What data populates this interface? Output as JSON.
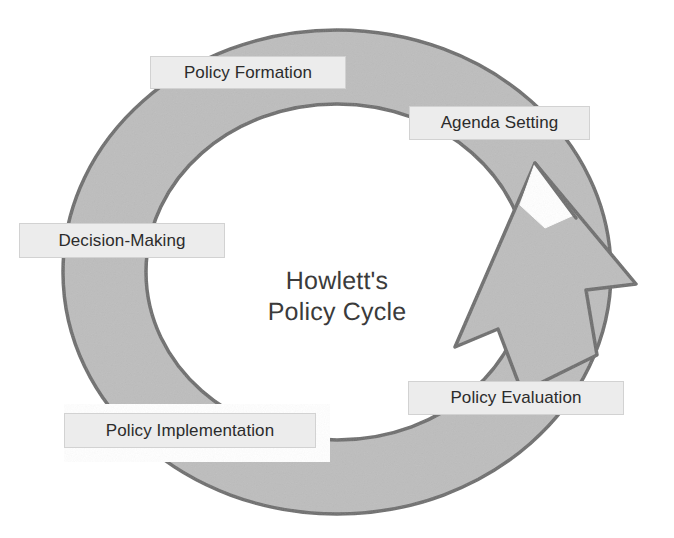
{
  "diagram": {
    "kind": "policy-cycle-diagram",
    "center_title": "Howlett's\nPolicy Cycle",
    "center_title_line1": "Howlett's",
    "center_title_line2": "Policy Cycle",
    "background_color": "#ffffff",
    "ring": {
      "fill_color": "#bdbdbd",
      "outline_color": "#6e6e6e",
      "center_x": 337,
      "center_y": 272,
      "outer_radius_x": 274,
      "outer_radius_y": 242,
      "inner_radius_x": 191,
      "inner_radius_y": 168,
      "direction": "clockwise"
    },
    "arrow": {
      "name": "cycle-arrow-head",
      "fill_color": "#bdbdbd",
      "outline_color": "#6e6e6e",
      "points_toward": "up-right",
      "tip_x": 636,
      "tip_y": 284
    },
    "stages": [
      {
        "id": "policy-formation",
        "label": "Policy Formation",
        "order": 1,
        "position": "top-left"
      },
      {
        "id": "agenda-setting",
        "label": "Agenda Setting",
        "order": 2,
        "position": "top-right"
      },
      {
        "id": "decision-making",
        "label": "Decision-Making",
        "order": 3,
        "position": "left"
      },
      {
        "id": "policy-implementation",
        "label": "Policy Implementation",
        "order": 4,
        "position": "bottom-left"
      },
      {
        "id": "policy-evaluation",
        "label": "Policy Evaluation",
        "order": 5,
        "position": "bottom-right"
      }
    ],
    "label_style": {
      "fill_color": "#ececec",
      "border_color": "#d2d2d2",
      "text_color": "#2b2b2b"
    }
  }
}
